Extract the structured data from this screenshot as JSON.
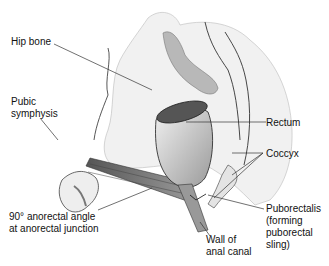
{
  "diagram": {
    "labels": {
      "hip_bone": "Hip bone",
      "pubic_symphysis": "Pubic\nsymphysis",
      "rectum": "Rectum",
      "coccyx": "Coccyx",
      "puborectalis": "Puborectalis\n(forming\npuborectal\nsling)",
      "wall_of_anal_canal": "Wall of\nanal canal",
      "anorectal_angle": "90° anorectal angle\nat anorectal junction"
    },
    "colors": {
      "background": "#ffffff",
      "outline": "#222222",
      "bone_fill": "#eeeeee",
      "rectum_fill": "#d6d6d6",
      "muscle_fill": "#7a7a7a",
      "leader_line": "#333333"
    }
  }
}
